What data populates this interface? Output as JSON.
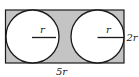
{
  "diagram": {
    "colors": {
      "shade": "#c4c4c4",
      "stroke": "#1a1a1a",
      "circle_fill": "#ffffff"
    },
    "labels": {
      "left_radius": "r",
      "right_radius": "r",
      "height": "2r",
      "width": "5r"
    }
  }
}
